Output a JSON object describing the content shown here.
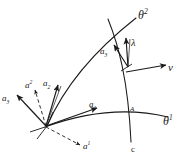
{
  "figure": {
    "background_color": "#ffffff",
    "stroke_color": "#1a1a1a",
    "labels": {
      "theta2": "θ",
      "theta2_sup": "2",
      "theta1": "θ",
      "theta1_sup": "1",
      "lambda": "λ",
      "nu": "ν",
      "a3_mid": "a",
      "a3_mid_sub": "3",
      "a3": "a",
      "a3_sub": "3",
      "a2_contravariant": "a",
      "a2_contravariant_sup": "2",
      "a2": "a",
      "a2_sub": "2",
      "a1": "a",
      "a1_sub": "1",
      "a1_contravariant": "a",
      "a1_contravariant_sup": "1",
      "curve_c": "c",
      "point_marker": "A"
    },
    "elements": {
      "coordinate_curve_theta1": "theta1-coordinate-curve",
      "coordinate_curve_theta2": "theta2-coordinate-curve",
      "curve_c": "curve-c",
      "vector_a1": "covariant-base-vector-a1",
      "vector_a2": "covariant-base-vector-a2",
      "vector_a3": "covariant-base-vector-a3",
      "vector_a1_contra": "contravariant-base-vector-a1",
      "vector_a2_contra": "contravariant-base-vector-a2",
      "vector_a3_mid": "normal-vector-a3-at-point",
      "vector_lambda": "tangent-vector-lambda",
      "vector_nu": "normal-vector-nu"
    }
  }
}
